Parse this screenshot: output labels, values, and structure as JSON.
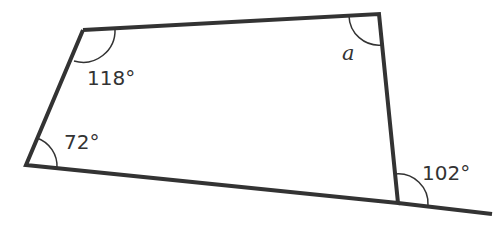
{
  "diagram": {
    "shape": "quadrilateral",
    "vertices": {
      "top_left": [
        83,
        30
      ],
      "top_right": [
        379,
        14
      ],
      "bottom_right": [
        398,
        203
      ],
      "bottom_left": [
        26,
        165
      ]
    },
    "extension_end": [
      492,
      214
    ],
    "angles": {
      "top_left": "118°",
      "top_right": "a",
      "bottom_left": "72°",
      "exterior_bottom_right": "102°"
    },
    "colors": {
      "line": "#333333",
      "background": "#ffffff"
    }
  }
}
